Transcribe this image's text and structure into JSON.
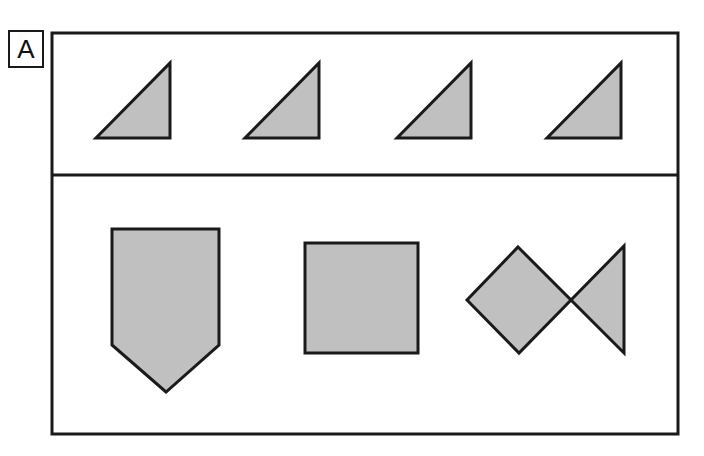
{
  "figure": {
    "panel_label": "A",
    "background_color": "#ffffff",
    "outline_color": "#1a1a1a",
    "fill_color": "#c0c0c0",
    "canvas": {
      "width": 704,
      "height": 456
    },
    "frame": {
      "x": 52,
      "y": 33,
      "width": 626,
      "height": 401,
      "stroke_width": 3
    },
    "divider": {
      "y": 175,
      "x1": 52,
      "x2": 678,
      "stroke_width": 3
    },
    "label_box": {
      "x": 8,
      "y": 30,
      "width": 36,
      "height": 38
    }
  },
  "rows": [
    {
      "name": "top-row",
      "description": "Four identical right triangles",
      "shapes": [
        {
          "id": "triangle-1",
          "type": "right-triangle",
          "points": "96,138 170,138 170,63",
          "fill": "#c0c0c0",
          "stroke": "#1a1a1a",
          "stroke_width": 3
        },
        {
          "id": "triangle-2",
          "type": "right-triangle",
          "points": "245,138 319,138 319,63",
          "fill": "#c0c0c0",
          "stroke": "#1a1a1a",
          "stroke_width": 3
        },
        {
          "id": "triangle-3",
          "type": "right-triangle",
          "points": "397,138 471,138 471,63",
          "fill": "#c0c0c0",
          "stroke": "#1a1a1a",
          "stroke_width": 3
        },
        {
          "id": "triangle-4",
          "type": "right-triangle",
          "points": "547,138 621,138 621,63",
          "fill": "#c0c0c0",
          "stroke": "#1a1a1a",
          "stroke_width": 3
        }
      ]
    },
    {
      "name": "bottom-row",
      "description": "Pentagon shield, square, diamond joined to a left-pointing triangle",
      "shapes": [
        {
          "id": "pentagon-shield",
          "type": "pentagon",
          "points": "112,229 219,229 219,345 166,392 112,345",
          "fill": "#c0c0c0",
          "stroke": "#1a1a1a",
          "stroke_width": 3
        },
        {
          "id": "square",
          "type": "square",
          "points": "305,243 418,243 418,353 305,353",
          "fill": "#c0c0c0",
          "stroke": "#1a1a1a",
          "stroke_width": 3
        },
        {
          "id": "diamond",
          "type": "rotated-square",
          "points": "518,247 571,300 519,353 467,300",
          "fill": "#c0c0c0",
          "stroke": "#1a1a1a",
          "stroke_width": 3
        },
        {
          "id": "left-pointing-triangle",
          "type": "triangle",
          "points": "571,300 624,246 624,353",
          "fill": "#c0c0c0",
          "stroke": "#1a1a1a",
          "stroke_width": 3
        }
      ]
    }
  ]
}
